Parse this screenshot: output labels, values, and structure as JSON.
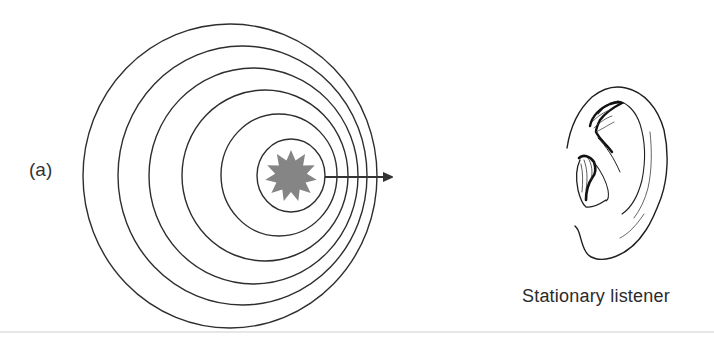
{
  "figure": {
    "panel_label": "(a)",
    "caption": "Stationary listener",
    "colors": {
      "line": "#2e2e2e",
      "source_fill": "#858585",
      "arrow": "#333333",
      "rule": "#e6e6e6",
      "background": "#ffffff"
    },
    "wavefronts": [
      {
        "cx": 230,
        "cy": 176,
        "rx": 147,
        "ry": 152
      },
      {
        "cx": 242.5,
        "cy": 175.5,
        "rx": 124.5,
        "ry": 129.5
      },
      {
        "cx": 253.5,
        "cy": 176,
        "rx": 104.5,
        "ry": 108
      },
      {
        "cx": 265,
        "cy": 175.5,
        "rx": 83,
        "ry": 85.5
      },
      {
        "cx": 279,
        "cy": 175,
        "rx": 58,
        "ry": 61
      },
      {
        "cx": 291,
        "cy": 175.5,
        "rx": 34,
        "ry": 36.5
      }
    ],
    "source": {
      "cx": 291,
      "cy": 176,
      "outer_r": 26,
      "inner_r": 16,
      "points": 11
    },
    "motion_arrow": {
      "x1": 325,
      "y1": 177,
      "x2": 400,
      "y2": 177
    }
  }
}
